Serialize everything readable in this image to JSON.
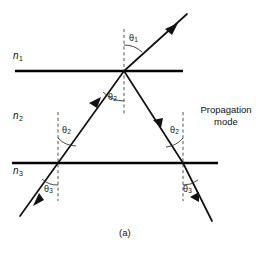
{
  "figure": {
    "caption": "(a)",
    "annotation": {
      "line1": "Propagation",
      "line2": "mode"
    },
    "media": [
      {
        "id": "n1",
        "symbol": "n",
        "subscript": "1",
        "x": 13,
        "y": 51
      },
      {
        "id": "n2",
        "symbol": "n",
        "subscript": "2",
        "x": 13,
        "y": 111
      },
      {
        "id": "n3",
        "symbol": "n",
        "subscript": "3",
        "x": 13,
        "y": 166
      }
    ],
    "angles": [
      {
        "id": "theta1-top",
        "symbol": "θ",
        "subscript": "1",
        "x": 129,
        "y": 34
      },
      {
        "id": "theta2-top",
        "symbol": "θ",
        "subscript": "2",
        "x": 108,
        "y": 93
      },
      {
        "id": "theta2-left",
        "symbol": "θ",
        "subscript": "2",
        "x": 62,
        "y": 126
      },
      {
        "id": "theta2-right",
        "symbol": "θ",
        "subscript": "2",
        "x": 170,
        "y": 126
      },
      {
        "id": "theta3-left",
        "symbol": "θ",
        "subscript": "3",
        "x": 44,
        "y": 185
      },
      {
        "id": "theta3-right",
        "symbol": "θ",
        "subscript": "3",
        "x": 183,
        "y": 185
      }
    ],
    "colors": {
      "ink": "#111111",
      "interface": "#000000",
      "normal": "#555555",
      "background": "#ffffff"
    },
    "geometry": {
      "interfaces": [
        {
          "id": "n1-n2-boundary",
          "x1": 15,
          "y1": 71,
          "x2": 183,
          "y2": 71
        },
        {
          "id": "n2-n3-boundary",
          "x1": 12,
          "y1": 163,
          "x2": 218,
          "y2": 163
        }
      ],
      "normals": [
        {
          "id": "normal-top",
          "x": 124,
          "y1": 29,
          "y2": 116
        },
        {
          "id": "normal-left",
          "x": 58,
          "y1": 112,
          "y2": 201
        },
        {
          "id": "normal-right",
          "x": 183,
          "y1": 112,
          "y2": 201
        }
      ],
      "vertices": {
        "top": {
          "x": 124,
          "y": 71
        },
        "left": {
          "x": 58,
          "y": 163
        },
        "right": {
          "x": 183,
          "y": 163
        }
      },
      "rays": [
        {
          "id": "incident-ray-n3",
          "x1": 20,
          "y1": 216,
          "x2": 58,
          "y2": 163
        },
        {
          "id": "ray-left-to-top",
          "x1": 58,
          "y1": 163,
          "x2": 124,
          "y2": 71
        },
        {
          "id": "ray-top-to-right",
          "x1": 124,
          "y1": 71,
          "x2": 183,
          "y2": 163
        },
        {
          "id": "transmitted-ray-n1",
          "x1": 124,
          "y1": 71,
          "x2": 187,
          "y2": 14
        },
        {
          "id": "transmitted-ray-n3",
          "x1": 183,
          "y1": 163,
          "x2": 212,
          "y2": 221
        }
      ]
    }
  }
}
